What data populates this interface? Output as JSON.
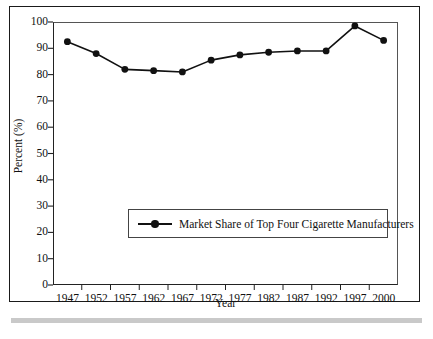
{
  "chart_data": {
    "type": "line",
    "title": "",
    "subtitle": "",
    "xlabel": "Year",
    "ylabel": "Percent (%)",
    "categories": [
      "1947",
      "1952",
      "1957",
      "1962",
      "1967",
      "1972",
      "1977",
      "1982",
      "1987",
      "1992",
      "1997",
      "2000"
    ],
    "series": [
      {
        "name": "Market Share of Top Four Cigarette Manufacturers",
        "values": [
          92.5,
          88.0,
          82.0,
          81.5,
          81.0,
          85.5,
          87.5,
          88.5,
          89.0,
          89.0,
          98.5,
          93.0
        ],
        "color": "#111111",
        "marker": "circle",
        "line_width": 1.6
      }
    ],
    "ylim": [
      0,
      100
    ],
    "ytick_values": [
      0,
      10,
      20,
      30,
      40,
      50,
      60,
      70,
      80,
      90,
      100
    ],
    "ytick_labels": [
      "0",
      "10",
      "20",
      "30",
      "40",
      "50",
      "60",
      "70",
      "80",
      "90",
      "100"
    ],
    "grid": false,
    "legend": {
      "position": "inside-center",
      "entries": [
        "Market Share of Top Four Cigarette Manufacturers"
      ]
    },
    "axis_color": "#222222",
    "background": "#ffffff"
  },
  "figure": {
    "frame_color": "#1a1a1a",
    "rule_color": "#c9c9c9"
  }
}
